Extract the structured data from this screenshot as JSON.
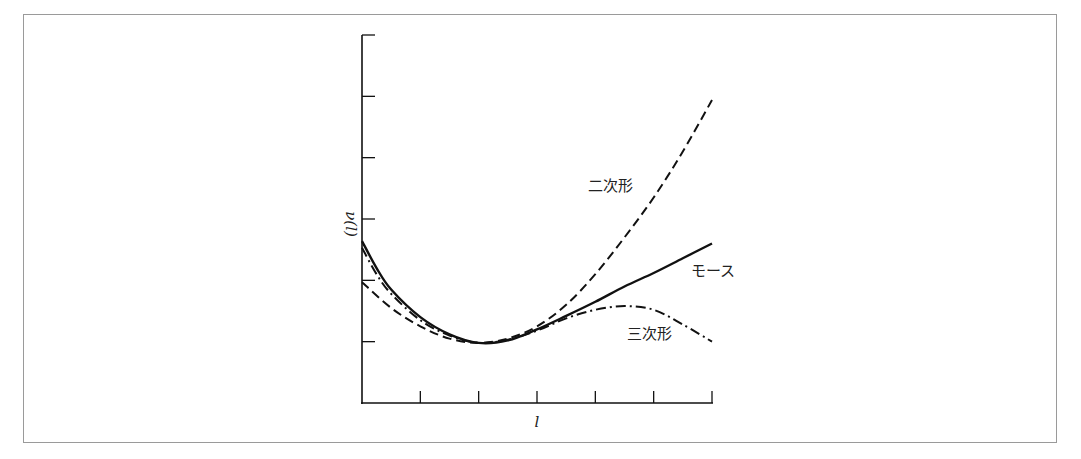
{
  "chart_data": {
    "type": "line",
    "title": "",
    "xlabel": "l",
    "ylabel": "ν(l)",
    "xlim": [
      0,
      6
    ],
    "ylim": [
      0,
      6
    ],
    "x_ticks": [
      0,
      1,
      2,
      3,
      4,
      5,
      6
    ],
    "y_ticks": [
      0,
      1,
      2,
      3,
      4,
      5,
      6
    ],
    "tick_labels_shown": false,
    "grid": false,
    "legend": "inline labels",
    "series": [
      {
        "name": "モース",
        "style": "solid",
        "points": [
          [
            0,
            2.64
          ],
          [
            0.25,
            2.2
          ],
          [
            0.5,
            1.85
          ],
          [
            1,
            1.4
          ],
          [
            1.5,
            1.12
          ],
          [
            2,
            0.98
          ],
          [
            2.5,
            1.02
          ],
          [
            3,
            1.2
          ],
          [
            3.5,
            1.42
          ],
          [
            4,
            1.65
          ],
          [
            4.5,
            1.9
          ],
          [
            5,
            2.12
          ],
          [
            5.5,
            2.36
          ],
          [
            6,
            2.6
          ]
        ]
      },
      {
        "name": "二次形",
        "style": "dashed",
        "points": [
          [
            0,
            1.97
          ],
          [
            0.5,
            1.55
          ],
          [
            1,
            1.25
          ],
          [
            1.5,
            1.05
          ],
          [
            2,
            0.98
          ],
          [
            2.5,
            1.05
          ],
          [
            3,
            1.25
          ],
          [
            3.5,
            1.6
          ],
          [
            4,
            2.1
          ],
          [
            4.5,
            2.7
          ],
          [
            5,
            3.35
          ],
          [
            5.5,
            4.1
          ],
          [
            6,
            4.94
          ]
        ]
      },
      {
        "name": "三次形",
        "style": "dash-dot",
        "points": [
          [
            0,
            2.53
          ],
          [
            0.25,
            2.1
          ],
          [
            0.5,
            1.78
          ],
          [
            1,
            1.35
          ],
          [
            1.5,
            1.1
          ],
          [
            2,
            0.98
          ],
          [
            2.5,
            1.03
          ],
          [
            3,
            1.18
          ],
          [
            3.5,
            1.38
          ],
          [
            4,
            1.52
          ],
          [
            4.5,
            1.58
          ],
          [
            5,
            1.52
          ],
          [
            5.5,
            1.28
          ],
          [
            6,
            1.0
          ]
        ]
      }
    ],
    "annotations": [
      {
        "text": "二次形",
        "near": "quadratic curve, upper right"
      },
      {
        "text": "モース",
        "near": "end of solid curve, right"
      },
      {
        "text": "三次形",
        "near": "below dash-dot curve, lower right"
      }
    ]
  }
}
